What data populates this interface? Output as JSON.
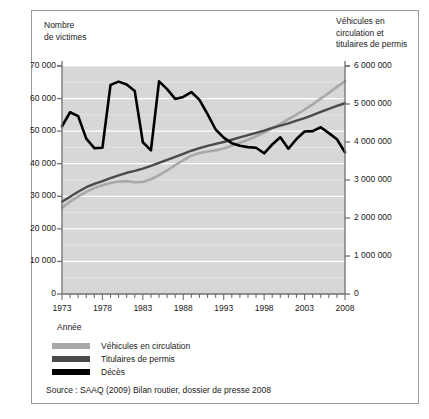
{
  "figure": {
    "left_axis_title": "Nombre\nde victimes",
    "right_axis_title": "Véhicules en\ncirculation et\ntitulaires de permis",
    "x_axis_title": "Année",
    "source": "Source : SAAQ (2009) Bilan routier, dossier de presse 2008"
  },
  "colors": {
    "plot_background": "#d7d7d7",
    "gridline": "#ffffff",
    "axis": "#6f6f6f",
    "vehicules": "#a9a9a9",
    "permis": "#4a4a4a",
    "deces": "#000000",
    "frame": "#9a9a9a"
  },
  "legend": {
    "position": "below-axis",
    "items": [
      {
        "label": "Véhicules en circulation",
        "color": "#a9a9a9"
      },
      {
        "label": "Titulaires de permis",
        "color": "#4a4a4a"
      },
      {
        "label": "Décès",
        "color": "#000000"
      }
    ]
  },
  "chart_data": {
    "type": "line",
    "title": "",
    "subtitle": "",
    "xlabel": "Année",
    "ylabel": "Nombre de victimes",
    "y2label": "Véhicules en circulation et titulaires de permis",
    "grid": true,
    "legend_position": "below",
    "xlim": [
      1973,
      2008
    ],
    "ylim": [
      0,
      70000
    ],
    "y2lim": [
      0,
      6000000
    ],
    "x": [
      1973,
      1974,
      1975,
      1976,
      1977,
      1978,
      1979,
      1980,
      1981,
      1982,
      1983,
      1984,
      1985,
      1986,
      1987,
      1988,
      1989,
      1990,
      1991,
      1992,
      1993,
      1994,
      1995,
      1996,
      1997,
      1998,
      1999,
      2000,
      2001,
      2002,
      2003,
      2004,
      2005,
      2006,
      2007,
      2008
    ],
    "x_tick_labels": [
      "1973",
      "1978",
      "1983",
      "1988",
      "1993",
      "1998",
      "2003",
      "2008"
    ],
    "x_tick_values": [
      1973,
      1978,
      1983,
      1988,
      1993,
      1998,
      2003,
      2008
    ],
    "x_minor_tick_step": 1,
    "y_tick_labels": [
      "0",
      "10 000",
      "20 000",
      "30 000",
      "40 000",
      "50 000",
      "60 000",
      "70 000"
    ],
    "y_tick_values": [
      0,
      10000,
      20000,
      30000,
      40000,
      50000,
      60000,
      70000
    ],
    "y2_tick_labels": [
      "0",
      "1 000 000",
      "2 000 000",
      "3 000 000",
      "4 000 000",
      "5 000 000",
      "6 000 000"
    ],
    "y2_tick_values": [
      0,
      1000000,
      2000000,
      3000000,
      4000000,
      5000000,
      6000000
    ],
    "series": [
      {
        "name": "Décès",
        "color": "#000000",
        "axis": "left",
        "width": 2.6,
        "values": [
          51500,
          55800,
          54600,
          47700,
          44800,
          44900,
          64200,
          65200,
          64300,
          62300,
          46600,
          44100,
          65300,
          62900,
          59900,
          60500,
          62000,
          59600,
          55200,
          50500,
          48000,
          46300,
          45500,
          45100,
          44900,
          43200,
          45900,
          48100,
          44600,
          47600,
          49900,
          50000,
          51200,
          49400,
          47500,
          43500
        ]
      },
      {
        "name": "Titulaires de permis",
        "color": "#4a4a4a",
        "axis": "right",
        "width": 2.4,
        "values": [
          2430000,
          2560000,
          2690000,
          2810000,
          2900000,
          2970000,
          3050000,
          3120000,
          3190000,
          3240000,
          3300000,
          3370000,
          3450000,
          3530000,
          3610000,
          3690000,
          3770000,
          3840000,
          3900000,
          3950000,
          4000000,
          4060000,
          4120000,
          4180000,
          4240000,
          4300000,
          4370000,
          4430000,
          4490000,
          4560000,
          4630000,
          4710000,
          4790000,
          4870000,
          4950000,
          5020000
        ]
      },
      {
        "name": "Véhicules en circulation",
        "color": "#a9a9a9",
        "axis": "right",
        "width": 2.6,
        "values": [
          2270000,
          2430000,
          2570000,
          2690000,
          2790000,
          2860000,
          2920000,
          2960000,
          2970000,
          2940000,
          2950000,
          3020000,
          3130000,
          3250000,
          3390000,
          3520000,
          3640000,
          3710000,
          3750000,
          3780000,
          3830000,
          3900000,
          3980000,
          4060000,
          4150000,
          4250000,
          4360000,
          4480000,
          4600000,
          4720000,
          4850000,
          4990000,
          5140000,
          5290000,
          5450000,
          5600000
        ]
      }
    ]
  }
}
